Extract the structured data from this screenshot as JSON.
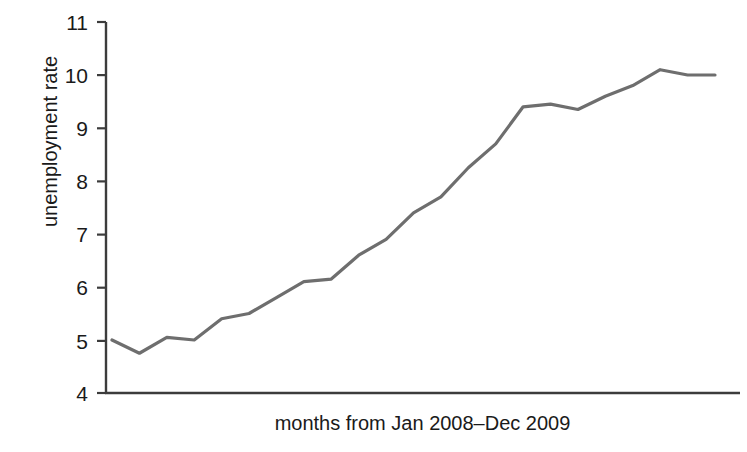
{
  "chart_data": {
    "type": "line",
    "title": "",
    "xlabel": "months from Jan 2008–Dec 2009",
    "ylabel": "unemployment rate",
    "ylim": [
      4,
      11
    ],
    "yticks": [
      4,
      5,
      6,
      7,
      8,
      9,
      10,
      11
    ],
    "ytick_labels": [
      "4",
      "5",
      "6",
      "7",
      "8",
      "9",
      "10",
      "11"
    ],
    "xticks": [],
    "xtick_labels": [],
    "grid": false,
    "legend": null,
    "line_color": "#6e6e6e",
    "axis_color": "#3c3c3c",
    "x": [
      1,
      2,
      3,
      4,
      5,
      6,
      7,
      8,
      9,
      10,
      11,
      12,
      13,
      14,
      15,
      16,
      17,
      18,
      19,
      20,
      21,
      22,
      23
    ],
    "values": [
      5.0,
      4.75,
      5.05,
      5.0,
      5.4,
      5.5,
      5.8,
      6.1,
      6.15,
      6.6,
      6.9,
      7.4,
      7.7,
      8.25,
      8.7,
      9.4,
      9.45,
      9.35,
      9.6,
      9.8,
      10.1,
      10.0,
      10.0
    ],
    "series": [
      {
        "name": "unemployment rate",
        "values": [
          5.0,
          4.75,
          5.05,
          5.0,
          5.4,
          5.5,
          5.8,
          6.1,
          6.15,
          6.6,
          6.9,
          7.4,
          7.7,
          8.25,
          8.7,
          9.4,
          9.45,
          9.35,
          9.6,
          9.8,
          10.1,
          10.0,
          10.0
        ]
      }
    ]
  },
  "axis": {
    "y_title": "unemployment rate",
    "x_title": "months from Jan 2008–Dec 2009",
    "tick_11": "11",
    "tick_10": "10",
    "tick_9": "9",
    "tick_8": "8",
    "tick_7": "7",
    "tick_6": "6",
    "tick_5": "5",
    "tick_4": "4"
  }
}
